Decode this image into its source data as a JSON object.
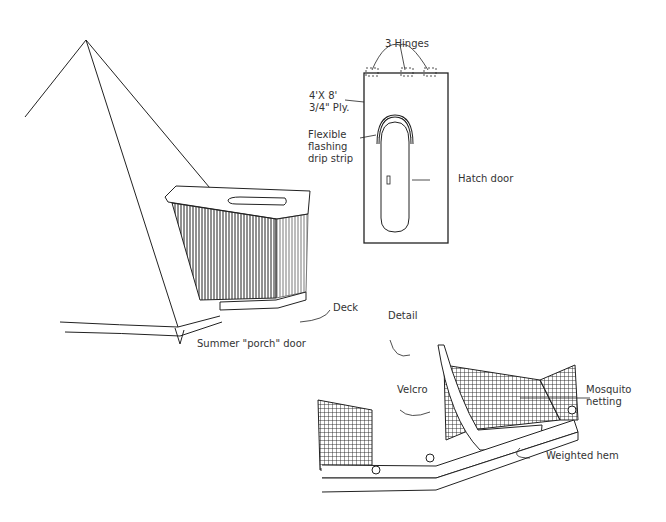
{
  "labels": {
    "hinges": "3 Hinges",
    "plywood_size": "4'X 8'",
    "plywood_thickness": "3/4\" Ply.",
    "flashing": "Flexible\nflashing\ndrip strip",
    "hatch_door": "Hatch door",
    "deck": "Deck",
    "porch_door": "Summer \"porch\" door",
    "detail": "Detail",
    "velcro": "Velcro",
    "mosquito_netting": "Mosquito\nnetting",
    "weighted_hem": "Weighted hem"
  },
  "colors": {
    "ink": "#222222",
    "background": "#ffffff",
    "text": "#333333"
  }
}
